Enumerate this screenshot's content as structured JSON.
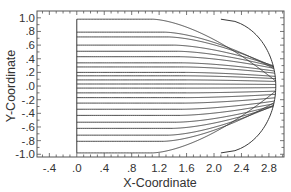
{
  "chart_data": {
    "type": "line",
    "title": "",
    "xlabel": "X-Coordinate",
    "ylabel": "Y-Coordinate",
    "xlim": [
      -0.58,
      3.02
    ],
    "ylim": [
      -1.04,
      1.1
    ],
    "grid": false,
    "legend": null,
    "x_ticks": [
      -0.4,
      0.0,
      0.4,
      0.8,
      1.2,
      1.6,
      2.0,
      2.4,
      2.8
    ],
    "x_tick_labels": [
      "-.4",
      ".0",
      ".4",
      ".8",
      "1.2",
      "1.6",
      "2.0",
      "2.4",
      "2.8"
    ],
    "y_ticks": [
      1.0,
      0.8,
      0.6,
      0.4,
      0.2,
      0.0,
      -0.2,
      -0.4,
      -0.6,
      -0.8,
      -1.0
    ],
    "y_tick_labels": [
      "1.0",
      ".8",
      ".6",
      ".4",
      ".2",
      ".0",
      "-.2",
      "-.4",
      "-.6",
      "-.8",
      "-1.0"
    ],
    "left_boundary_x": 0.0,
    "bow": {
      "tip_x": 2.9,
      "half_height": 0.98,
      "shoulder_x": 2.1
    },
    "streamlines_y_start": [
      0.98,
      0.79,
      0.72,
      0.6,
      0.51,
      0.43,
      0.34,
      0.28,
      0.2,
      0.15,
      0.09,
      0.03,
      -0.03,
      -0.1,
      -0.17,
      -0.25,
      -0.34,
      -0.43,
      -0.53,
      -0.62,
      -0.72,
      -0.81,
      -0.98
    ],
    "series": [
      {
        "name": "streamline",
        "x": [
          0.0,
          1.6,
          2.2
        ],
        "y_start_ref": "streamlines_y_start"
      }
    ]
  }
}
